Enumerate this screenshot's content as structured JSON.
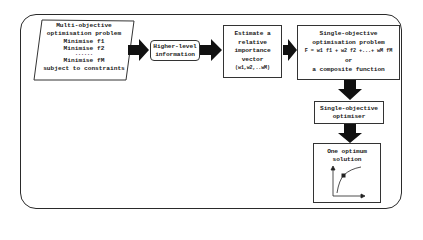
{
  "diagram": {
    "nodes": {
      "multi_objective": {
        "title_line1": "Multi-objective",
        "title_line2": "optimisation problem",
        "objectives": [
          "Minimise f1",
          "Minimise f2",
          "......",
          "Minimise fM"
        ],
        "constraint": "subject to constraints",
        "shape": "parallelogram"
      },
      "higher_level": {
        "line1": "Higher-level",
        "line2": "information",
        "shape": "rounded-rect"
      },
      "estimate": {
        "line1": "Estimate a",
        "line2": "relative",
        "line3": "importance",
        "line4": "vector",
        "line5": "(w1,w2,..wM)",
        "shape": "rect"
      },
      "single_problem": {
        "line1": "Single-objective",
        "line2": "optimisation problem",
        "formula": "F = w1 f1 + w2 f2 +...+ wM fM",
        "line4": "or",
        "line5": "a composite function",
        "shape": "rect"
      },
      "optimizer": {
        "line1": "Single-objective",
        "line2": "optimiser",
        "shape": "rect"
      },
      "solution": {
        "line1": "One optimum",
        "line2": "solution",
        "shape": "rect",
        "has_mini_plot": true
      }
    },
    "edges": [
      {
        "from": "multi_objective",
        "to": "higher_level",
        "style": "thick-arrow"
      },
      {
        "from": "higher_level",
        "to": "estimate",
        "style": "thick-arrow"
      },
      {
        "from": "estimate",
        "to": "single_problem",
        "style": "thick-arrow"
      },
      {
        "from": "single_problem",
        "to": "optimizer",
        "style": "thick-arrow"
      },
      {
        "from": "optimizer",
        "to": "solution",
        "style": "thick-arrow"
      }
    ],
    "colors": {
      "stroke": "#2a2a2a",
      "arrow_fill": "#111111",
      "background": "#ffffff"
    }
  }
}
